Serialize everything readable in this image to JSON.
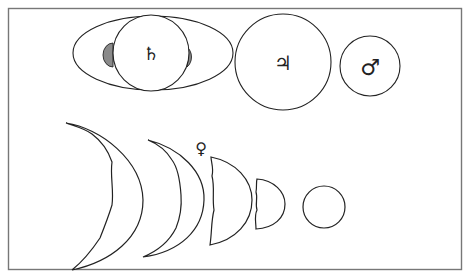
{
  "figure": {
    "frame_color": "#777777",
    "line_color": "#222222",
    "shade_color": "#8a8a8a",
    "planets": [
      {
        "name": "Saturn",
        "symbol": "♄"
      },
      {
        "name": "Jupiter",
        "symbol": "♃"
      },
      {
        "name": "Mars",
        "symbol": "♂"
      },
      {
        "name": "Venus",
        "symbol": "♀"
      }
    ],
    "venus_phases": [
      "large crescent",
      "crescent",
      "half",
      "gibbous",
      "full"
    ]
  }
}
